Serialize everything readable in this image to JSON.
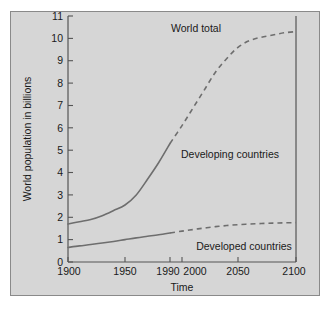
{
  "chart_data": {
    "type": "line",
    "title": "",
    "xlabel": "Time",
    "ylabel": "World population in billions",
    "xlim": [
      1900,
      2100
    ],
    "ylim": [
      0,
      11
    ],
    "grid": false,
    "legend_position": "inline-annotations",
    "xticks": [
      "1900",
      "1950",
      "1990",
      "2000",
      "2050",
      "2100"
    ],
    "xtick_values": [
      1900,
      1950,
      1990,
      2000,
      2050,
      2100
    ],
    "xtick_positions_px": [
      68,
      125,
      170,
      182,
      238,
      296
    ],
    "yticks": [
      "0",
      "1",
      "2",
      "3",
      "4",
      "5",
      "6",
      "7",
      "8",
      "9",
      "10",
      "11"
    ],
    "ytick_values": [
      0,
      1,
      2,
      3,
      4,
      5,
      6,
      7,
      8,
      9,
      10,
      11
    ],
    "series": [
      {
        "name": "World total",
        "style": "solid-then-dashed",
        "dash_starts_at": 1990,
        "x": [
          1900,
          1910,
          1920,
          1930,
          1940,
          1950,
          1960,
          1970,
          1980,
          1990,
          2000,
          2010,
          2020,
          2030,
          2040,
          2050,
          2060,
          2070,
          2080,
          2090,
          2100
        ],
        "values": [
          1.7,
          1.8,
          1.9,
          2.07,
          2.3,
          2.55,
          3.0,
          3.7,
          4.45,
          5.3,
          6.1,
          6.9,
          7.7,
          8.5,
          9.1,
          9.6,
          9.9,
          10.05,
          10.15,
          10.25,
          10.3
        ]
      },
      {
        "name": "Developed countries",
        "style": "solid-then-dashed",
        "dash_starts_at": 1990,
        "x": [
          1900,
          1910,
          1920,
          1930,
          1940,
          1950,
          1960,
          1970,
          1980,
          1990,
          2000,
          2010,
          2020,
          2030,
          2040,
          2050,
          2060,
          2070,
          2080,
          2090,
          2100
        ],
        "values": [
          0.65,
          0.72,
          0.78,
          0.85,
          0.92,
          1.0,
          1.08,
          1.15,
          1.22,
          1.3,
          1.38,
          1.45,
          1.52,
          1.58,
          1.63,
          1.67,
          1.7,
          1.72,
          1.74,
          1.75,
          1.76
        ]
      }
    ],
    "annotations": [
      {
        "text": "World total",
        "x_px": 196,
        "y_px": 29
      },
      {
        "text": "Developing countries",
        "x_px": 230,
        "y_px": 155
      },
      {
        "text": "Developed countries",
        "x_px": 244,
        "y_px": 247
      }
    ]
  },
  "axis": {
    "y_title": "World population in billions",
    "x_title": "Time"
  },
  "colors": {
    "panel_background": "#d6d6d6",
    "page_background": "#ffffff",
    "curve": "#6e6e6e",
    "axis": "#555555",
    "text": "#1a1a1a"
  }
}
